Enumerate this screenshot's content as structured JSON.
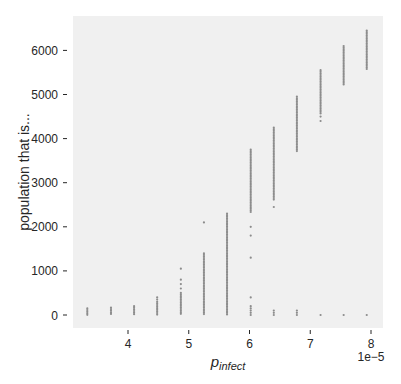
{
  "chart_data": {
    "type": "scatter",
    "title": "",
    "xlabel": "p_infect",
    "xlabel_main": "p",
    "xlabel_sub": "infect",
    "ylabel": "population that is...",
    "x_offset_label": "1e−5",
    "x_ticks": [
      4,
      5,
      6,
      7,
      8
    ],
    "y_ticks": [
      0,
      1000,
      2000,
      3000,
      4000,
      5000,
      6000
    ],
    "xlim": [
      3.1,
      8.2
    ],
    "ylim": [
      -300,
      6800
    ],
    "grid": false,
    "background": "#f0f0f0",
    "marker_color": "#8c8c8c",
    "series": [
      {
        "name": "population",
        "columns": [
          {
            "x": 3.33,
            "dense": [
              0,
              150
            ],
            "sparse": []
          },
          {
            "x": 3.72,
            "dense": [
              0,
              170
            ],
            "sparse": []
          },
          {
            "x": 4.1,
            "dense": [
              0,
              200
            ],
            "sparse": []
          },
          {
            "x": 4.48,
            "dense": [
              0,
              300
            ],
            "sparse": [
              350,
              400
            ]
          },
          {
            "x": 4.87,
            "dense": [
              0,
              500
            ],
            "sparse": [
              600,
              700,
              800,
              1050
            ]
          },
          {
            "x": 5.25,
            "dense": [
              0,
              1400
            ],
            "sparse": [
              2100
            ]
          },
          {
            "x": 5.63,
            "dense": [
              0,
              2300
            ],
            "sparse": []
          },
          {
            "x": 6.02,
            "dense": [
              2300,
              3750
            ],
            "sparse": [
              0,
              50,
              100,
              150,
              200,
              400,
              1300,
              1800,
              2000
            ]
          },
          {
            "x": 6.4,
            "dense": [
              2600,
              4250
            ],
            "sparse": [
              0,
              50,
              100,
              2450
            ]
          },
          {
            "x": 6.78,
            "dense": [
              3700,
              4950
            ],
            "sparse": [
              0,
              50,
              100
            ]
          },
          {
            "x": 7.17,
            "dense": [
              4550,
              5550
            ],
            "sparse": [
              0,
              4400,
              4500
            ]
          },
          {
            "x": 7.55,
            "dense": [
              5200,
              6100
            ],
            "sparse": [
              0
            ]
          },
          {
            "x": 7.93,
            "dense": [
              5550,
              6450
            ],
            "sparse": [
              0
            ]
          }
        ]
      }
    ]
  }
}
